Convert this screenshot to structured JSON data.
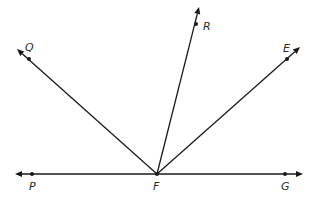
{
  "diagram": {
    "type": "geometry-rays",
    "vertex": {
      "label": "F",
      "x": 157,
      "y": 174,
      "label_x": 153,
      "label_y": 190
    },
    "line": {
      "name": "line PG",
      "left_arrow": {
        "x": 15,
        "y": 174
      },
      "right_arrow": {
        "x": 303,
        "y": 174
      }
    },
    "points": [
      {
        "label": "P",
        "x": 32,
        "y": 174,
        "label_x": 29,
        "label_y": 190
      },
      {
        "label": "G",
        "x": 285,
        "y": 174,
        "label_x": 281,
        "label_y": 190
      },
      {
        "label": "Q",
        "x": 29,
        "y": 59,
        "label_x": 25,
        "label_y": 51
      },
      {
        "label": "R",
        "x": 196,
        "y": 24,
        "label_x": 203,
        "label_y": 30
      },
      {
        "label": "E",
        "x": 287,
        "y": 59,
        "label_x": 283,
        "label_y": 52
      }
    ],
    "rays": [
      {
        "name": "ray FQ",
        "through": "Q",
        "tip": {
          "x": 17,
          "y": 49
        }
      },
      {
        "name": "ray FR",
        "through": "R",
        "tip": {
          "x": 199,
          "y": 7
        }
      },
      {
        "name": "ray FE",
        "through": "E",
        "tip": {
          "x": 300,
          "y": 47
        }
      },
      {
        "name": "ray FP",
        "through": "P",
        "tip": {
          "x": 15,
          "y": 174
        }
      },
      {
        "name": "ray FG",
        "through": "G",
        "tip": {
          "x": 303,
          "y": 174
        }
      }
    ],
    "colors": {
      "stroke": "#1a1a1a",
      "label": "#2a2a2a",
      "background": "#ffffff"
    }
  }
}
